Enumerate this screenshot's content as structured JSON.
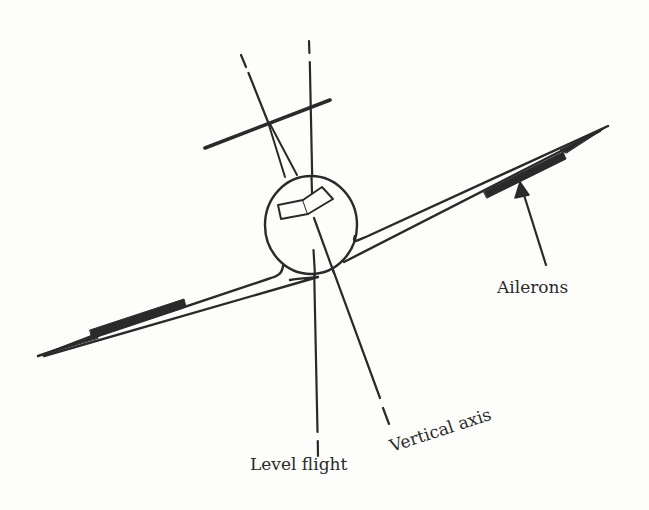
{
  "diagram": {
    "type": "airplane-front-view-banked",
    "labels": {
      "ailerons": "Ailerons",
      "vertical_axis": "Vertical axis",
      "level_flight": "Level flight"
    },
    "colors": {
      "ink": "#2a2a2a",
      "background": "#fdfdfc"
    }
  }
}
